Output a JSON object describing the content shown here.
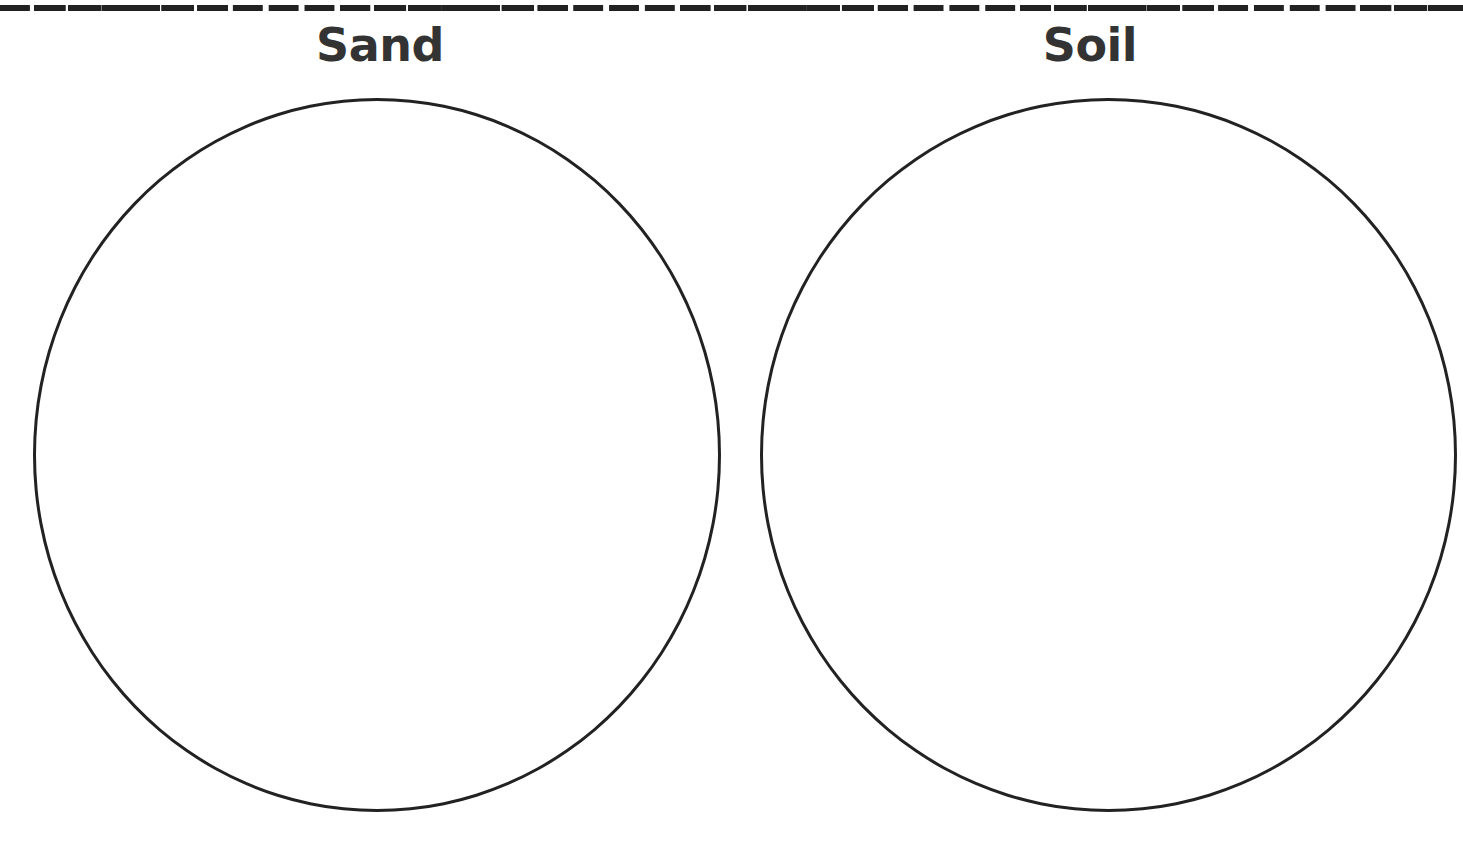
{
  "worksheet": {
    "cut_line": "dashed",
    "sections": [
      {
        "heading": "Sand"
      },
      {
        "heading": "Soil"
      }
    ]
  },
  "colors": {
    "line": "#222222",
    "heading": "#333333",
    "background": "#ffffff"
  }
}
